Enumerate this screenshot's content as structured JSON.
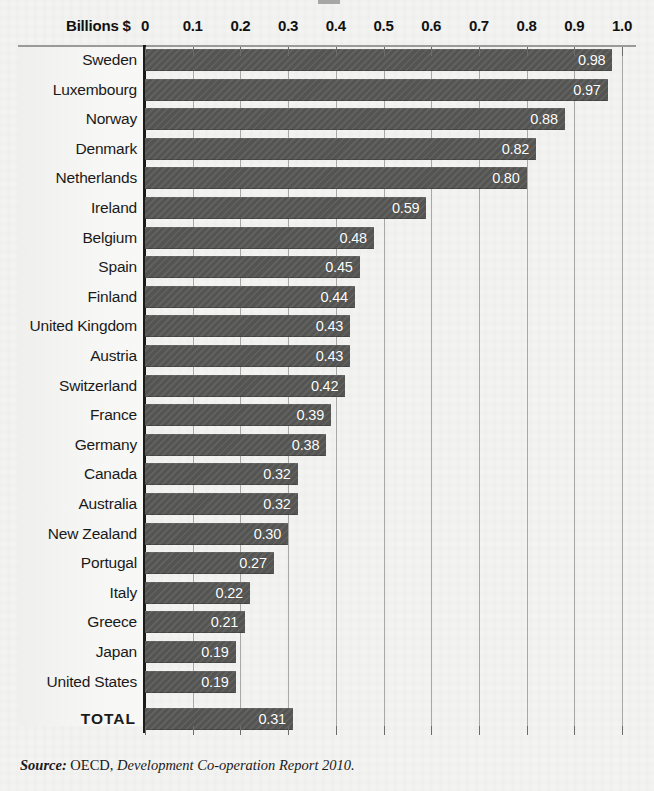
{
  "axis": {
    "unit_label": "Billions $",
    "ticks": [
      "0",
      "0.1",
      "0.2",
      "0.3",
      "0.4",
      "0.5",
      "0.6",
      "0.7",
      "0.8",
      "0.9",
      "1.0"
    ]
  },
  "source": {
    "prefix": "Source:",
    "organization": " OECD, ",
    "publication": "Development Co-operation Report 2010."
  },
  "colors": {
    "bar_fill": "#585856",
    "background": "#f3f3f1",
    "axis": "#1b1b1b",
    "gridline": "#a8a8a6",
    "value_text": "#ffffff"
  },
  "chart_data": {
    "type": "bar",
    "orientation": "horizontal",
    "title": "",
    "xlabel": "Billions $",
    "ylabel": "",
    "xlim": [
      0,
      1.0
    ],
    "xticks": [
      0,
      0.1,
      0.2,
      0.3,
      0.4,
      0.5,
      0.6,
      0.7,
      0.8,
      0.9,
      1.0
    ],
    "grid": true,
    "legend": "none",
    "value_labels": true,
    "categories": [
      "Sweden",
      "Luxembourg",
      "Norway",
      "Denmark",
      "Netherlands",
      "Ireland",
      "Belgium",
      "Spain",
      "Finland",
      "United Kingdom",
      "Austria",
      "Switzerland",
      "France",
      "Germany",
      "Canada",
      "Australia",
      "New Zealand",
      "Portugal",
      "Italy",
      "Greece",
      "Japan",
      "United States",
      "TOTAL"
    ],
    "values": [
      0.98,
      0.97,
      0.88,
      0.82,
      0.8,
      0.59,
      0.48,
      0.45,
      0.44,
      0.43,
      0.43,
      0.42,
      0.39,
      0.38,
      0.32,
      0.32,
      0.3,
      0.27,
      0.22,
      0.21,
      0.19,
      0.19,
      0.31
    ],
    "value_label_texts": [
      "0.98",
      "0.97",
      "0.88",
      "0.82",
      "0.80",
      "0.59",
      "0.48",
      "0.45",
      "0.44",
      "0.43",
      "0.43",
      "0.42",
      "0.39",
      "0.38",
      "0.32",
      "0.32",
      "0.30",
      "0.27",
      "0.22",
      "0.21",
      "0.19",
      "0.19",
      "0.31"
    ]
  }
}
